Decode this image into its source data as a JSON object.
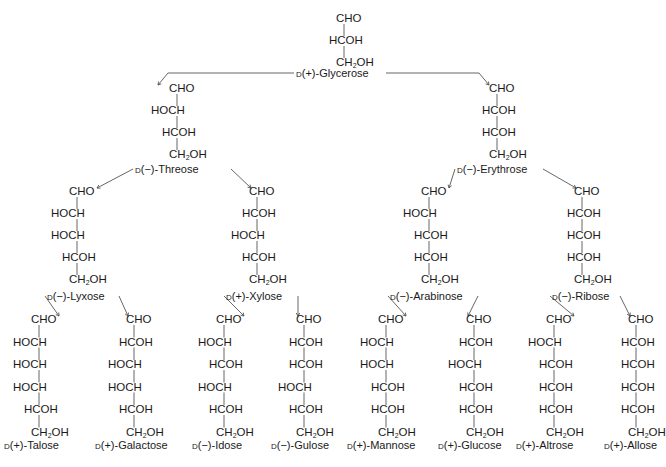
{
  "colors": {
    "text": "#1a1a1a",
    "line": "#555555",
    "background": "#ffffff"
  },
  "molecules": [
    {
      "id": "glycerose",
      "config": "D",
      "rotation": "(+)",
      "name": "Glycerose",
      "label": "D(+)-Glycerose",
      "carbons": 3,
      "groups": [
        "CHO",
        "HCOH",
        "CH2OH"
      ]
    },
    {
      "id": "threose",
      "config": "D",
      "rotation": "(−)",
      "name": "Threose",
      "label": "D(−)-Threose",
      "carbons": 4,
      "groups": [
        "CHO",
        "HOCH",
        "HCOH",
        "CH2OH"
      ]
    },
    {
      "id": "erythrose",
      "config": "D",
      "rotation": "(−)",
      "name": "Erythrose",
      "label": "D(−)-Erythrose",
      "carbons": 4,
      "groups": [
        "CHO",
        "HCOH",
        "HCOH",
        "CH2OH"
      ]
    },
    {
      "id": "lyxose",
      "config": "D",
      "rotation": "(−)",
      "name": "Lyxose",
      "label": "D(−)-Lyxose",
      "carbons": 5,
      "groups": [
        "CHO",
        "HOCH",
        "HOCH",
        "HCOH",
        "CH2OH"
      ]
    },
    {
      "id": "xylose",
      "config": "D",
      "rotation": "(+)",
      "name": "Xylose",
      "label": "D(+)-Xylose",
      "carbons": 5,
      "groups": [
        "CHO",
        "HCOH",
        "HOCH",
        "HCOH",
        "CH2OH"
      ]
    },
    {
      "id": "arabinose",
      "config": "D",
      "rotation": "(−)",
      "name": "Arabinose",
      "label": "D(−)-Arabinose",
      "carbons": 5,
      "groups": [
        "CHO",
        "HOCH",
        "HCOH",
        "HCOH",
        "CH2OH"
      ]
    },
    {
      "id": "ribose",
      "config": "D",
      "rotation": "(−)",
      "name": "Ribose",
      "label": "D(−)-Ribose",
      "carbons": 5,
      "groups": [
        "CHO",
        "HCOH",
        "HCOH",
        "HCOH",
        "CH2OH"
      ]
    },
    {
      "id": "talose",
      "config": "D",
      "rotation": "(+)",
      "name": "Talose",
      "label": "D(+)-Talose",
      "carbons": 6,
      "groups": [
        "CHO",
        "HOCH",
        "HOCH",
        "HOCH",
        "HCOH",
        "CH2OH"
      ]
    },
    {
      "id": "galactose",
      "config": "D",
      "rotation": "(+)",
      "name": "Galactose",
      "label": "D(+)-Galactose",
      "carbons": 6,
      "groups": [
        "CHO",
        "HCOH",
        "HOCH",
        "HOCH",
        "HCOH",
        "CH2OH"
      ]
    },
    {
      "id": "idose",
      "config": "D",
      "rotation": "(−)",
      "name": "Idose",
      "label": "D(−)-Idose",
      "carbons": 6,
      "groups": [
        "CHO",
        "HOCH",
        "HCOH",
        "HOCH",
        "HCOH",
        "CH2OH"
      ]
    },
    {
      "id": "gulose",
      "config": "D",
      "rotation": "(−)",
      "name": "Gulose",
      "label": "D(−)-Gulose",
      "carbons": 6,
      "groups": [
        "CHO",
        "HCOH",
        "HCOH",
        "HOCH",
        "HCOH",
        "CH2OH"
      ]
    },
    {
      "id": "mannose",
      "config": "D",
      "rotation": "(+)",
      "name": "Mannose",
      "label": "D(+)-Mannose",
      "carbons": 6,
      "groups": [
        "CHO",
        "HOCH",
        "HOCH",
        "HCOH",
        "HCOH",
        "CH2OH"
      ]
    },
    {
      "id": "glucose",
      "config": "D",
      "rotation": "(+)",
      "name": "Glucose",
      "label": "D(+)-Glucose",
      "carbons": 6,
      "groups": [
        "CHO",
        "HCOH",
        "HOCH",
        "HCOH",
        "HCOH",
        "CH2OH"
      ]
    },
    {
      "id": "altrose",
      "config": "D",
      "rotation": "(+)",
      "name": "Altrose",
      "label": "D(+)-Altrose",
      "carbons": 6,
      "groups": [
        "CHO",
        "HOCH",
        "HCOH",
        "HCOH",
        "HCOH",
        "CH2OH"
      ]
    },
    {
      "id": "allose",
      "config": "D",
      "rotation": "(+)",
      "name": "Allose",
      "label": "D(+)-Allose",
      "carbons": 6,
      "groups": [
        "CHO",
        "HCOH",
        "HCOH",
        "HCOH",
        "HCOH",
        "CH2OH"
      ]
    }
  ],
  "edges": [
    [
      "glycerose",
      "threose"
    ],
    [
      "glycerose",
      "erythrose"
    ],
    [
      "threose",
      "lyxose"
    ],
    [
      "threose",
      "xylose"
    ],
    [
      "erythrose",
      "arabinose"
    ],
    [
      "erythrose",
      "ribose"
    ],
    [
      "lyxose",
      "talose"
    ],
    [
      "lyxose",
      "galactose"
    ],
    [
      "xylose",
      "idose"
    ],
    [
      "xylose",
      "gulose"
    ],
    [
      "arabinose",
      "mannose"
    ],
    [
      "arabinose",
      "glucose"
    ],
    [
      "ribose",
      "altrose"
    ],
    [
      "ribose",
      "allose"
    ]
  ]
}
